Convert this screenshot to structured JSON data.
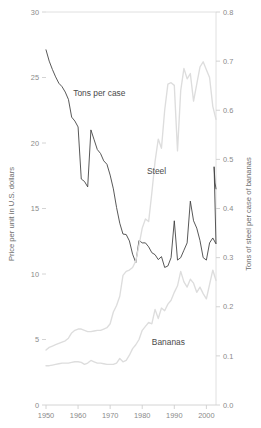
{
  "chart_data": {
    "type": "line",
    "title": "",
    "xlabel": "",
    "ylabel": "Price per unit in U.S. dollars",
    "y2label": "Tons of steel per case of bananas",
    "xlim": [
      1950,
      2003
    ],
    "ylim": [
      0,
      30
    ],
    "y2lim": [
      0.0,
      0.8
    ],
    "grid": false,
    "legend_position": "inline-annotations",
    "xticks": [
      "1950",
      "1960",
      "1970",
      "1980",
      "1990",
      "2000"
    ],
    "xtick_values": [
      1950,
      1960,
      1970,
      1980,
      1990,
      2000
    ],
    "yticks": [
      "0",
      "5",
      "10",
      "15",
      "20",
      "25",
      "30"
    ],
    "ytick_values": [
      0,
      5,
      10,
      15,
      20,
      25,
      30
    ],
    "y2ticks": [
      "0.0",
      "0.1",
      "0.2",
      "0.3",
      "0.4",
      "0.5",
      "0.6",
      "0.7",
      "0.8"
    ],
    "y2tick_values": [
      0.0,
      0.1,
      0.2,
      0.3,
      0.4,
      0.5,
      0.6,
      0.7,
      0.8
    ],
    "annotations": [
      {
        "text": "Tons per case",
        "x": 1958.5,
        "y": 23.6
      },
      {
        "text": "Steel",
        "x": 1981.5,
        "y": 17.6
      },
      {
        "text": "Bananas",
        "x": 1983.0,
        "y": 4.6
      }
    ],
    "series": [
      {
        "name": "Tons per case",
        "axis": "right",
        "color": "#3a3a3a",
        "x": [
          1950,
          1951,
          1952,
          1953,
          1954,
          1955,
          1956,
          1957,
          1958,
          1959,
          1960,
          1961,
          1962,
          1963,
          1964,
          1965,
          1966,
          1967,
          1968,
          1969,
          1970,
          1971,
          1972,
          1973,
          1974,
          1975,
          1976,
          1977,
          1978,
          1979,
          1980,
          1981,
          1982,
          1983,
          1984,
          1985,
          1986,
          1987,
          1988,
          1989,
          1990,
          1991,
          1992,
          1993,
          1994,
          1995,
          1996,
          1997,
          1998,
          1999,
          2000,
          2001,
          2002,
          2003
        ],
        "values": [
          0.723,
          0.7,
          0.683,
          0.668,
          0.655,
          0.648,
          0.637,
          0.622,
          0.586,
          0.578,
          0.566,
          0.46,
          0.455,
          0.444,
          0.56,
          0.54,
          0.52,
          0.512,
          0.497,
          0.49,
          0.468,
          0.44,
          0.402,
          0.37,
          0.348,
          0.347,
          0.334,
          0.307,
          0.29,
          0.335,
          0.33,
          0.33,
          0.322,
          0.31,
          0.306,
          0.296,
          0.302,
          0.28,
          0.283,
          0.3,
          0.375,
          0.295,
          0.3,
          0.315,
          0.33,
          0.415,
          0.375,
          0.36,
          0.335,
          0.3,
          0.295,
          0.33,
          0.34,
          0.328
        ],
        "tail_x": [
          2002.4,
          2002.7,
          2003.0
        ],
        "tail_values": [
          0.485,
          0.452,
          0.44
        ]
      },
      {
        "name": "Steel",
        "axis": "left",
        "color": "#dddddd",
        "x": [
          1950,
          1951,
          1952,
          1953,
          1954,
          1955,
          1956,
          1957,
          1958,
          1959,
          1960,
          1961,
          1962,
          1963,
          1964,
          1965,
          1966,
          1967,
          1968,
          1969,
          1970,
          1971,
          1972,
          1973,
          1974,
          1975,
          1976,
          1977,
          1978,
          1979,
          1980,
          1981,
          1982,
          1983,
          1984,
          1985,
          1986,
          1987,
          1988,
          1989,
          1990,
          1991,
          1992,
          1993,
          1994,
          1995,
          1996,
          1997,
          1998,
          1999,
          2000,
          2001,
          2002,
          2003
        ],
        "values": [
          4.2,
          4.4,
          4.5,
          4.6,
          4.7,
          4.8,
          4.9,
          5.1,
          5.5,
          5.7,
          5.8,
          5.8,
          5.7,
          5.6,
          5.6,
          5.65,
          5.7,
          5.7,
          5.8,
          5.9,
          6.2,
          7.1,
          7.6,
          8.3,
          9.9,
          10.2,
          10.3,
          10.5,
          11.0,
          12.2,
          13.5,
          14.2,
          14.0,
          16.2,
          18.6,
          20.3,
          19.6,
          22.5,
          24.5,
          24.6,
          24.4,
          19.4,
          24.0,
          25.7,
          24.9,
          25.3,
          23.2,
          24.5,
          25.8,
          26.2,
          25.6,
          25.0,
          22.8,
          21.8
        ],
        "tail_x": [
          2003.0
        ],
        "tail_values": [
          21.8
        ]
      },
      {
        "name": "Bananas",
        "axis": "left",
        "color": "#dddddd",
        "x": [
          1950,
          1951,
          1952,
          1953,
          1954,
          1955,
          1956,
          1957,
          1958,
          1959,
          1960,
          1961,
          1962,
          1963,
          1964,
          1965,
          1966,
          1967,
          1968,
          1969,
          1970,
          1971,
          1972,
          1973,
          1974,
          1975,
          1976,
          1977,
          1978,
          1979,
          1980,
          1981,
          1982,
          1983,
          1984,
          1985,
          1986,
          1987,
          1988,
          1989,
          1990,
          1991,
          1992,
          1993,
          1994,
          1995,
          1996,
          1997,
          1998,
          1999,
          2000,
          2001,
          2002,
          2003
        ],
        "values": [
          3.0,
          3.0,
          3.05,
          3.1,
          3.15,
          3.2,
          3.2,
          3.2,
          3.25,
          3.3,
          3.3,
          3.25,
          3.1,
          3.2,
          3.4,
          3.3,
          3.2,
          3.2,
          3.15,
          3.1,
          3.1,
          3.1,
          3.2,
          3.55,
          3.3,
          3.4,
          3.8,
          4.3,
          4.6,
          5.0,
          5.7,
          6.0,
          6.3,
          6.2,
          7.3,
          6.6,
          7.4,
          7.2,
          7.7,
          8.0,
          8.6,
          9.1,
          10.2,
          9.4,
          9.0,
          9.6,
          9.3,
          8.6,
          9.0,
          8.5,
          8.1,
          9.2,
          10.3,
          9.5
        ],
        "tail_x": [
          2003.0
        ],
        "tail_values": [
          9.5
        ]
      }
    ]
  },
  "axes": {
    "left_title": "Price per unit in U.S. dollars",
    "right_title": "Tons of steel per case of bananas"
  }
}
